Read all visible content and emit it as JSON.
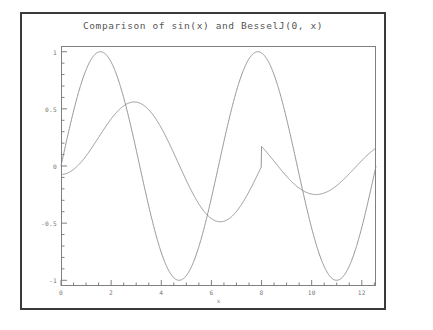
{
  "window": {
    "border_color": "#3a3a3a",
    "background": "#ffffff"
  },
  "chart_data": {
    "type": "line",
    "title": "Comparison of sin(x) and BesselJ(0, x)",
    "xlabel": "x",
    "ylabel": "",
    "xlim": [
      0,
      12.566370614359172
    ],
    "ylim": [
      -1.05,
      1.05
    ],
    "grid": false,
    "legend": "none",
    "axis_color": "#808080",
    "line_color": "#8a8a8a",
    "x_ticks": [
      "0",
      "2",
      "4",
      "6",
      "8",
      "10",
      "12"
    ],
    "x_tick_values": [
      0,
      2,
      4,
      6,
      8,
      10,
      12
    ],
    "x_minor_tick_step": 0.5,
    "y_ticks": [
      "1",
      "0.5",
      "0",
      "-0.5",
      "-1"
    ],
    "y_tick_values": [
      1,
      0.5,
      0,
      -0.5,
      -1
    ],
    "y_minor_tick_step": 0.1,
    "series": [
      {
        "name": "sin(x)",
        "color": "#8a8a8a",
        "key_points": [
          {
            "x": 0,
            "y": 0
          },
          {
            "x": 1.5708,
            "y": 1
          },
          {
            "x": 3.1416,
            "y": 0
          },
          {
            "x": 4.7124,
            "y": -1
          },
          {
            "x": 6.2832,
            "y": 0
          },
          {
            "x": 7.854,
            "y": 1
          },
          {
            "x": 9.4248,
            "y": 0
          },
          {
            "x": 10.9956,
            "y": -1
          },
          {
            "x": 12.5664,
            "y": 0
          }
        ]
      },
      {
        "name": "BesselJ(0, x)",
        "color": "#8a8a8a",
        "key_points": [
          {
            "x": 0,
            "y": 1
          },
          {
            "x": 2.4048,
            "y": 0
          },
          {
            "x": 3.8317,
            "y": -0.4028
          },
          {
            "x": 5.5201,
            "y": 0
          },
          {
            "x": 7.0156,
            "y": 0.3001
          },
          {
            "x": 8.6537,
            "y": 0
          },
          {
            "x": 10.1735,
            "y": -0.2497
          },
          {
            "x": 11.7915,
            "y": 0
          },
          {
            "x": 12.5664,
            "y": 0.1424
          }
        ]
      }
    ]
  }
}
